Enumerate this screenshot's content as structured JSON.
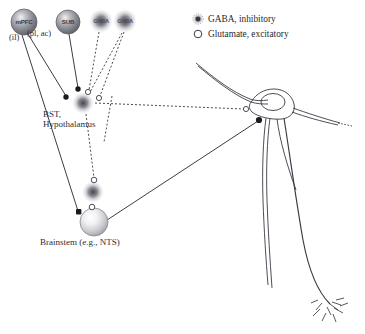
{
  "figure": {
    "type": "neuroanatomical-circuit-diagram",
    "background_color": "#ffffff"
  },
  "legend": {
    "items": [
      {
        "marker": "fuzzy-filled-dot",
        "label": "GABA, inhibitory",
        "color": "#4a4a52"
      },
      {
        "marker": "open-circle",
        "label": "Glutamate, excitatory",
        "color": "#4a4a52"
      }
    ]
  },
  "nodes": {
    "mpfc": {
      "label": "mPFC",
      "x": 24,
      "y": 22,
      "r": 13,
      "style": "sphere-dark"
    },
    "sub": {
      "label": "SUB",
      "x": 68,
      "y": 22,
      "r": 12,
      "style": "sphere-dark"
    },
    "gaba_a": {
      "label": "GABA",
      "x": 101,
      "y": 21,
      "r": 11,
      "style": "fuzzy"
    },
    "gaba_b": {
      "label": "GABA",
      "x": 125,
      "y": 21,
      "r": 11,
      "style": "fuzzy"
    },
    "bst": {
      "label": "",
      "x": 83,
      "y": 103,
      "r": 11,
      "style": "fuzzy"
    },
    "mid_gaba": {
      "label": "",
      "x": 93,
      "y": 192,
      "r": 11,
      "style": "fuzzy"
    },
    "brainstem": {
      "label": "",
      "x": 94,
      "y": 222,
      "r": 14,
      "style": "sphere-light"
    }
  },
  "labels": {
    "il": "(il)",
    "pl_ac": "(pl, ac)",
    "bst": "BST,",
    "hypothalamus": "Hypothalamus",
    "brainstem": "Brainstem (e.g., NTS)"
  },
  "synapses": {
    "gaba_terminals": [
      {
        "x": 66,
        "y": 97,
        "note": "mPFC onto BST"
      },
      {
        "x": 78,
        "y": 89,
        "note": "SUB onto BST"
      },
      {
        "x": 259,
        "y": 120,
        "note": "onto neuron soma"
      },
      {
        "x": 79,
        "y": 212,
        "note": "onto brainstem"
      }
    ],
    "glutamate_terminals": [
      {
        "x": 88,
        "y": 92,
        "note": "GABA-a input region"
      },
      {
        "x": 99,
        "y": 97,
        "note": "GABA-b input region"
      },
      {
        "x": 94,
        "y": 180,
        "note": "above mid node"
      },
      {
        "x": 93,
        "y": 206,
        "note": "below mid node"
      },
      {
        "x": 246,
        "y": 109,
        "note": "neuron dendrite"
      }
    ]
  },
  "connections": {
    "solid": [
      {
        "from": "mPFC",
        "to": "BST-terminal"
      },
      {
        "from": "SUB",
        "to": "BST-terminal"
      },
      {
        "from": "mPFC",
        "to": "Brainstem-terminal"
      },
      {
        "from": "Brainstem",
        "to": "neuron-soma"
      }
    ],
    "dotted": [
      {
        "from": "GABA-a",
        "to": "BST"
      },
      {
        "from": "GABA-b",
        "to": "BST"
      },
      {
        "from": "BST",
        "to": "neuron-dendrite"
      },
      {
        "from": "BST",
        "to": "mid-node"
      },
      {
        "from": "mid-node",
        "to": "Brainstem"
      }
    ]
  },
  "neuron": {
    "soma_center": {
      "x": 272,
      "y": 105
    },
    "nucleus": {
      "x": 272,
      "y": 103,
      "rx": 12,
      "ry": 9
    },
    "description": "multipolar neuron with dendrites and long descending axon ending in terminal arbor"
  }
}
